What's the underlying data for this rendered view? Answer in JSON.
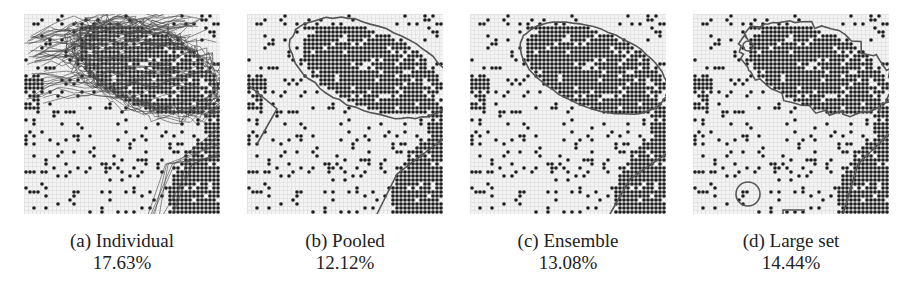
{
  "figure": {
    "panels": [
      {
        "id": "a",
        "caption": "(a) Individual",
        "error_rate": "17.63%",
        "contour_style": "many",
        "seed": 11
      },
      {
        "id": "b",
        "caption": "(b) Pooled",
        "error_rate": "12.12%",
        "contour_style": "smooth-wide",
        "seed": 23
      },
      {
        "id": "c",
        "caption": "(c) Ensemble",
        "error_rate": "13.08%",
        "contour_style": "smooth-tight",
        "seed": 37
      },
      {
        "id": "d",
        "caption": "(d) Large set",
        "error_rate": "14.44%",
        "contour_style": "jagged",
        "seed": 53
      }
    ],
    "colors": {
      "background": "#ffffff",
      "grid_light": "#e4e4e4",
      "dot_dark": "#1e1e1e",
      "contour": "#555555"
    }
  }
}
